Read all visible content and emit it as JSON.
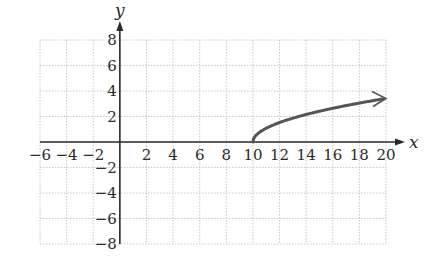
{
  "chart_data": {
    "type": "line",
    "title": "",
    "xlabel": "x",
    "ylabel": "y",
    "xlim": [
      -6,
      20
    ],
    "ylim": [
      -8,
      8
    ],
    "grid": true,
    "grid_step": 2,
    "x_ticks": [
      -6,
      -4,
      -2,
      2,
      4,
      6,
      8,
      10,
      12,
      14,
      16,
      18,
      20
    ],
    "y_ticks": [
      8,
      6,
      4,
      2,
      -2,
      -4,
      -6,
      -8
    ],
    "x_tick_labels": [
      "−6",
      "−4",
      "−2",
      "2",
      "4",
      "6",
      "8",
      "10",
      "12",
      "14",
      "16",
      "18",
      "20"
    ],
    "y_tick_labels": [
      "8",
      "6",
      "4",
      "2",
      "−2",
      "−4",
      "−6",
      "−8"
    ],
    "series": [
      {
        "name": "curve",
        "description": "square-root curve starting at (10, 0), arrow at right end",
        "color": "#555555",
        "x": [
          10,
          10.5,
          11,
          12,
          13,
          14,
          15,
          16,
          17,
          18,
          19,
          20
        ],
        "values": [
          0,
          0.71,
          1,
          1.41,
          1.73,
          2,
          2.24,
          2.45,
          2.65,
          2.83,
          3,
          3.16
        ],
        "end_marker": "arrow"
      }
    ],
    "legend": null
  },
  "colors": {
    "axis": "#2a2a2a",
    "grid": "#c8c8c8",
    "curve": "#555555"
  }
}
